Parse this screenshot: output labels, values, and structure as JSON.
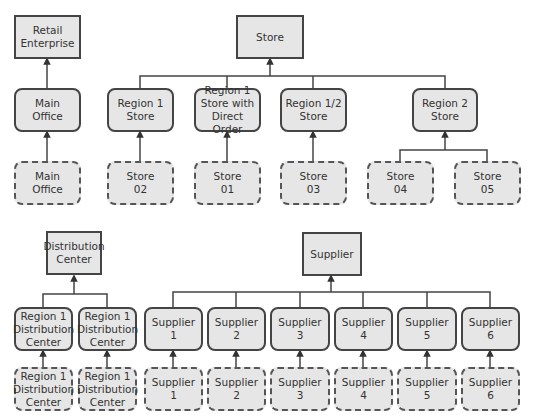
{
  "diagram": {
    "colors": {
      "box_fill": "#e6e6e6",
      "stroke": "#444444",
      "text": "#333333"
    },
    "legend_note": "Square = entity type, Rounded solid = group, Rounded dashed = instance",
    "nodes": {
      "retail_enterprise": "Retail\nEnterprise",
      "main_office": "Main\nOffice",
      "main_office_inst": "Main\nOffice",
      "store": "Store",
      "region1_store": "Region 1\nStore",
      "region1_store_do": "Region 1\nStore with\nDirect Order",
      "region12_store": "Region 1/2\nStore",
      "region2_store": "Region 2\nStore",
      "store02": "Store\n02",
      "store01": "Store\n01",
      "store03": "Store\n03",
      "store04": "Store\n04",
      "store05": "Store\n05",
      "distribution_center": "Distribution\nCenter",
      "r1dc_a": "Region 1\nDistribution\nCenter",
      "r1dc_b": "Region 1\nDistribution\nCenter",
      "r1dc_a_inst": "Region 1\nDistribution\nCenter",
      "r1dc_b_inst": "Region 1\nDistribution\nCenter",
      "supplier": "Supplier",
      "sup1": "Supplier\n1",
      "sup2": "Supplier\n2",
      "sup3": "Supplier\n3",
      "sup4": "Supplier\n4",
      "sup5": "Supplier\n5",
      "sup6": "Supplier\n6",
      "sup1_inst": "Supplier\n1",
      "sup2_inst": "Supplier\n2",
      "sup3_inst": "Supplier\n3",
      "sup4_inst": "Supplier\n4",
      "sup5_inst": "Supplier\n5",
      "sup6_inst": "Supplier\n6"
    }
  }
}
